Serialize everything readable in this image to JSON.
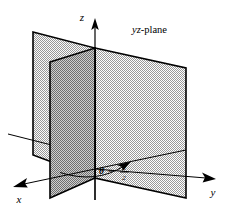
{
  "figure": {
    "name": "yz-plane-theta-pi-over-2",
    "background_color": "#ffffff",
    "stroke_color": "#000000",
    "labels": {
      "z_axis": "z",
      "x_axis": "x",
      "y_axis": "y",
      "plane_name_italic": "yz",
      "plane_name_rest": "-plane",
      "plane_name_full": "yz-plane",
      "theta_symbol": "θ",
      "equals": "=",
      "fraction_numerator": "π",
      "fraction_denominator": "2",
      "angle_equation": "θ = π/2"
    },
    "colors": {
      "yz_plane_fill": "#c9c9c9",
      "xz_plane_back_fill": "#c4c4c4",
      "xz_plane_front_fill": "#a8a8a8",
      "outline": "#000000",
      "axis": "#000000"
    },
    "geometry": {
      "origin": [
        95,
        178
      ],
      "z_top": [
        95,
        22
      ],
      "yz_plane_points": "95,48 186,68 186,198 95,178",
      "back_plane_points": "33,32 95,48 95,178 33,155",
      "front_plane_points": "50,62 95,48 95,178 50,198",
      "x_axis_from": [
        186,
        150
      ],
      "x_axis_to": [
        16,
        186
      ],
      "y_axis_from": [
        95,
        178
      ],
      "y_axis_to": [
        215,
        176
      ],
      "angle_arc": "sweep from x-axis to arrowhead at (123,163)"
    }
  }
}
